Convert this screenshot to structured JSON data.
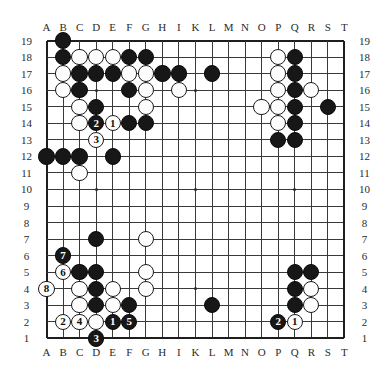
{
  "board": {
    "title": "Go board diagram",
    "size": 19,
    "column_labels": [
      "A",
      "B",
      "C",
      "D",
      "E",
      "F",
      "G",
      "H",
      "I",
      "K",
      "L",
      "M",
      "N",
      "O",
      "P",
      "Q",
      "R",
      "S",
      "T"
    ],
    "row_labels": [
      "19",
      "18",
      "17",
      "16",
      "15",
      "14",
      "13",
      "12",
      "11",
      "10",
      "9",
      "8",
      "7",
      "6",
      "5",
      "4",
      "3",
      "2",
      "1"
    ],
    "colors": {
      "background": "#ffffff",
      "grid": "#3a3a3a",
      "black_stone": "#171717",
      "white_stone": "#fdfdfd",
      "label": "#2b2b2b"
    },
    "hoshi": [
      {
        "col": "D",
        "row": 16
      },
      {
        "col": "K",
        "row": 16
      },
      {
        "col": "Q",
        "row": 16
      },
      {
        "col": "D",
        "row": 10
      },
      {
        "col": "K",
        "row": 10
      },
      {
        "col": "Q",
        "row": 10
      },
      {
        "col": "D",
        "row": 4
      },
      {
        "col": "K",
        "row": 4
      },
      {
        "col": "Q",
        "row": 4
      }
    ],
    "stones": [
      {
        "col": "B",
        "row": 19,
        "color": "black"
      },
      {
        "col": "B",
        "row": 18,
        "color": "black"
      },
      {
        "col": "C",
        "row": 18,
        "color": "white"
      },
      {
        "col": "D",
        "row": 18,
        "color": "white"
      },
      {
        "col": "E",
        "row": 18,
        "color": "white"
      },
      {
        "col": "F",
        "row": 18,
        "color": "black"
      },
      {
        "col": "G",
        "row": 18,
        "color": "black"
      },
      {
        "col": "P",
        "row": 18,
        "color": "white"
      },
      {
        "col": "Q",
        "row": 18,
        "color": "black"
      },
      {
        "col": "B",
        "row": 17,
        "color": "white"
      },
      {
        "col": "C",
        "row": 17,
        "color": "black"
      },
      {
        "col": "D",
        "row": 17,
        "color": "black"
      },
      {
        "col": "E",
        "row": 17,
        "color": "black"
      },
      {
        "col": "F",
        "row": 17,
        "color": "white"
      },
      {
        "col": "G",
        "row": 17,
        "color": "white"
      },
      {
        "col": "H",
        "row": 17,
        "color": "black"
      },
      {
        "col": "I",
        "row": 17,
        "color": "black"
      },
      {
        "col": "L",
        "row": 17,
        "color": "black"
      },
      {
        "col": "P",
        "row": 17,
        "color": "white"
      },
      {
        "col": "Q",
        "row": 17,
        "color": "black"
      },
      {
        "col": "B",
        "row": 16,
        "color": "white"
      },
      {
        "col": "C",
        "row": 16,
        "color": "black"
      },
      {
        "col": "F",
        "row": 16,
        "color": "black"
      },
      {
        "col": "G",
        "row": 16,
        "color": "white"
      },
      {
        "col": "I",
        "row": 16,
        "color": "white"
      },
      {
        "col": "P",
        "row": 16,
        "color": "white"
      },
      {
        "col": "Q",
        "row": 16,
        "color": "black"
      },
      {
        "col": "R",
        "row": 16,
        "color": "white"
      },
      {
        "col": "C",
        "row": 15,
        "color": "white"
      },
      {
        "col": "D",
        "row": 15,
        "color": "black"
      },
      {
        "col": "G",
        "row": 15,
        "color": "white"
      },
      {
        "col": "O",
        "row": 15,
        "color": "white"
      },
      {
        "col": "P",
        "row": 15,
        "color": "white"
      },
      {
        "col": "Q",
        "row": 15,
        "color": "black"
      },
      {
        "col": "S",
        "row": 15,
        "color": "black"
      },
      {
        "col": "C",
        "row": 14,
        "color": "white"
      },
      {
        "col": "D",
        "row": 14,
        "color": "black",
        "label": "2"
      },
      {
        "col": "E",
        "row": 14,
        "color": "white",
        "label": "1"
      },
      {
        "col": "F",
        "row": 14,
        "color": "black"
      },
      {
        "col": "G",
        "row": 14,
        "color": "black"
      },
      {
        "col": "P",
        "row": 14,
        "color": "white"
      },
      {
        "col": "Q",
        "row": 14,
        "color": "black"
      },
      {
        "col": "D",
        "row": 13,
        "color": "white",
        "label": "3"
      },
      {
        "col": "P",
        "row": 13,
        "color": "black"
      },
      {
        "col": "Q",
        "row": 13,
        "color": "black"
      },
      {
        "col": "A",
        "row": 12,
        "color": "black"
      },
      {
        "col": "B",
        "row": 12,
        "color": "black"
      },
      {
        "col": "C",
        "row": 12,
        "color": "black"
      },
      {
        "col": "E",
        "row": 12,
        "color": "black"
      },
      {
        "col": "C",
        "row": 11,
        "color": "white"
      },
      {
        "col": "D",
        "row": 7,
        "color": "black"
      },
      {
        "col": "G",
        "row": 7,
        "color": "white"
      },
      {
        "col": "B",
        "row": 6,
        "color": "black",
        "label": "7"
      },
      {
        "col": "B",
        "row": 5,
        "color": "white",
        "label": "6"
      },
      {
        "col": "C",
        "row": 5,
        "color": "black"
      },
      {
        "col": "D",
        "row": 5,
        "color": "black"
      },
      {
        "col": "G",
        "row": 5,
        "color": "white"
      },
      {
        "col": "Q",
        "row": 5,
        "color": "black"
      },
      {
        "col": "R",
        "row": 5,
        "color": "black"
      },
      {
        "col": "A",
        "row": 4,
        "color": "white",
        "label": "8"
      },
      {
        "col": "C",
        "row": 4,
        "color": "white"
      },
      {
        "col": "D",
        "row": 4,
        "color": "black"
      },
      {
        "col": "E",
        "row": 4,
        "color": "white"
      },
      {
        "col": "G",
        "row": 4,
        "color": "white"
      },
      {
        "col": "Q",
        "row": 4,
        "color": "black"
      },
      {
        "col": "R",
        "row": 4,
        "color": "white"
      },
      {
        "col": "C",
        "row": 3,
        "color": "white"
      },
      {
        "col": "D",
        "row": 3,
        "color": "black"
      },
      {
        "col": "E",
        "row": 3,
        "color": "white"
      },
      {
        "col": "F",
        "row": 3,
        "color": "black"
      },
      {
        "col": "L",
        "row": 3,
        "color": "black"
      },
      {
        "col": "Q",
        "row": 3,
        "color": "black"
      },
      {
        "col": "R",
        "row": 3,
        "color": "white"
      },
      {
        "col": "B",
        "row": 2,
        "color": "white",
        "label": "2"
      },
      {
        "col": "C",
        "row": 2,
        "color": "white",
        "label": "4"
      },
      {
        "col": "D",
        "row": 2,
        "color": "white"
      },
      {
        "col": "E",
        "row": 2,
        "color": "black",
        "label": "1"
      },
      {
        "col": "F",
        "row": 2,
        "color": "black",
        "label": "5"
      },
      {
        "col": "P",
        "row": 2,
        "color": "black",
        "label": "2"
      },
      {
        "col": "Q",
        "row": 2,
        "color": "white",
        "label": "1"
      },
      {
        "col": "D",
        "row": 1,
        "color": "black",
        "label": "3"
      }
    ]
  }
}
